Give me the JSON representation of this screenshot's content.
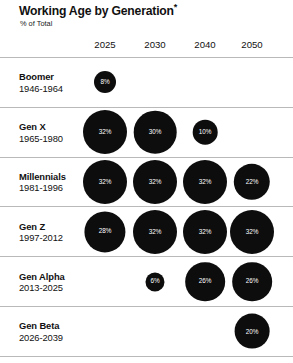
{
  "header": {
    "title": "Working Age by Generation",
    "title_footnote_marker": "*",
    "subtitle": "% of Total"
  },
  "chart_data": {
    "type": "bubble",
    "title": "Working Age by Generation*",
    "subtitle": "% of Total",
    "xlabel": "",
    "ylabel": "",
    "value_suffix": "%",
    "grid": false,
    "legend": "none",
    "bubble_color": "#0d0d0d",
    "label_color": "#ffffff",
    "categories": [
      "2025",
      "2030",
      "2040",
      "2050"
    ],
    "rows": [
      {
        "name": "Boomer",
        "years": "1946-1964",
        "values": [
          8,
          null,
          null,
          null
        ],
        "labels": [
          "8%",
          "",
          "",
          ""
        ]
      },
      {
        "name": "Gen X",
        "years": "1965-1980",
        "values": [
          32,
          30,
          10,
          null
        ],
        "labels": [
          "32%",
          "30%",
          "10%",
          ""
        ]
      },
      {
        "name": "Millennials",
        "years": "1981-1996",
        "values": [
          32,
          32,
          32,
          22
        ],
        "labels": [
          "32%",
          "32%",
          "32%",
          "22%"
        ]
      },
      {
        "name": "Gen Z",
        "years": "1997-2012",
        "values": [
          28,
          32,
          32,
          32
        ],
        "labels": [
          "28%",
          "32%",
          "32%",
          "32%"
        ]
      },
      {
        "name": "Gen Alpha",
        "years": "2013-2025",
        "values": [
          null,
          6,
          26,
          26
        ],
        "labels": [
          "",
          "6%",
          "26%",
          "26%"
        ]
      },
      {
        "name": "Gen Beta",
        "years": "2026-2039",
        "values": [
          null,
          null,
          null,
          20
        ],
        "labels": [
          "",
          "",
          "",
          "20%"
        ]
      }
    ]
  },
  "layout": {
    "column_centers": [
      105,
      155,
      205,
      252
    ],
    "max_bubble_diameter": 44,
    "min_bubble_diameter": 18,
    "max_value": 32
  }
}
